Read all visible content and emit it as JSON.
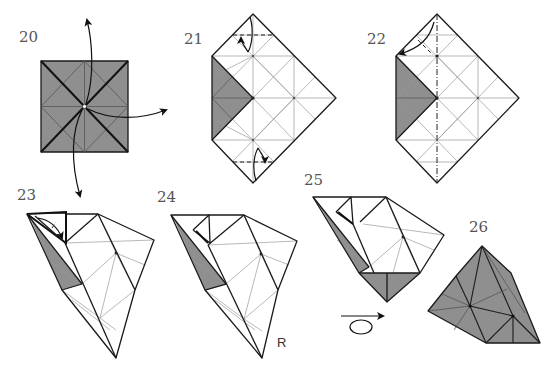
{
  "diagram": {
    "type": "origami-folding-instructions",
    "colors": {
      "paper_color_side": "#8f8f8f",
      "paper_white_side": "#ffffff",
      "line": "#1a1a1a",
      "crease": "#9a9a9a"
    },
    "steps": [
      {
        "number": "20",
        "label": "20",
        "description": "Square base with pleats, unfold flaps outward (arrows up, right, down)"
      },
      {
        "number": "21",
        "label": "21",
        "description": "Pentagon shape with gray triangles on left; valley folds at top and bottom tips"
      },
      {
        "number": "22",
        "label": "22",
        "description": "Center vertical mountain/valley line; fold top tip to left corner"
      },
      {
        "number": "23",
        "label": "23",
        "description": "Collapsed 3D form, fold inner flap with arrow"
      },
      {
        "number": "24",
        "label": "24",
        "description": "Result of fold; view rotated",
        "annotation": "R"
      },
      {
        "number": "25",
        "label": "25",
        "description": "Gray bottom triangles visible; turn over",
        "symbol": "turn-over"
      },
      {
        "number": "26",
        "label": "26",
        "description": "Finished unit, gray side"
      }
    ],
    "annotations": {
      "rotate_mark": "R",
      "turn_over_symbol": "turn-over"
    }
  }
}
